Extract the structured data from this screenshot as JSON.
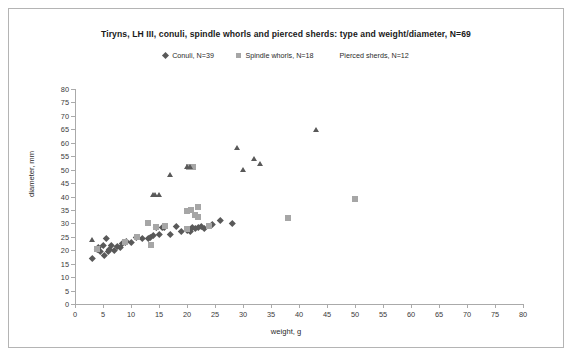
{
  "chart_data": {
    "type": "scatter",
    "title": "Tiryns, LH III,  conuli, spindle whorls and pierced sherds: type and weight/diameter, N=69",
    "xlabel": "weight, g",
    "ylabel": "diameter, mm",
    "xlim": [
      0,
      80
    ],
    "ylim": [
      0,
      80
    ],
    "xticks": [
      0,
      5,
      10,
      15,
      20,
      25,
      30,
      35,
      40,
      45,
      50,
      55,
      60,
      65,
      70,
      75,
      80
    ],
    "yticks": [
      0,
      5,
      10,
      15,
      20,
      25,
      30,
      35,
      40,
      45,
      50,
      55,
      60,
      65,
      70,
      75,
      80
    ],
    "grid": false,
    "legend_position": "top-center",
    "series": [
      {
        "name": "Conuli, N=39",
        "marker": "diamond",
        "color": "#595959",
        "points": [
          [
            3.0,
            17.0
          ],
          [
            4.0,
            20.5
          ],
          [
            4.2,
            21.0
          ],
          [
            4.5,
            19.5
          ],
          [
            5.0,
            22.0
          ],
          [
            5.2,
            18.0
          ],
          [
            5.5,
            24.5
          ],
          [
            6.0,
            19.5
          ],
          [
            6.2,
            20.5
          ],
          [
            6.5,
            22.0
          ],
          [
            7.0,
            20.0
          ],
          [
            7.5,
            21.5
          ],
          [
            8.0,
            21.0
          ],
          [
            8.5,
            22.5
          ],
          [
            9.0,
            23.0
          ],
          [
            9.2,
            23.5
          ],
          [
            10.0,
            23.0
          ],
          [
            11.0,
            25.0
          ],
          [
            12.0,
            24.5
          ],
          [
            13.0,
            24.5
          ],
          [
            13.5,
            25.0
          ],
          [
            14.0,
            25.5
          ],
          [
            14.5,
            28.5
          ],
          [
            15.0,
            26.0
          ],
          [
            15.5,
            28.5
          ],
          [
            16.0,
            28.5
          ],
          [
            17.0,
            26.0
          ],
          [
            18.0,
            29.0
          ],
          [
            19.0,
            27.0
          ],
          [
            20.0,
            27.5
          ],
          [
            20.5,
            27.0
          ],
          [
            21.0,
            28.5
          ],
          [
            21.5,
            28.0
          ],
          [
            22.0,
            28.5
          ],
          [
            23.0,
            28.0
          ],
          [
            24.5,
            29.5
          ],
          [
            26.0,
            31.0
          ],
          [
            28.0,
            30.0
          ],
          [
            22.5,
            29.0
          ]
        ]
      },
      {
        "name": "Spindle whorls, N=18",
        "marker": "square",
        "color": "#a6a6a6",
        "points": [
          [
            4.0,
            20.5
          ],
          [
            9.0,
            23.0
          ],
          [
            11.0,
            25.0
          ],
          [
            13.0,
            30.0
          ],
          [
            13.5,
            22.0
          ],
          [
            14.5,
            28.5
          ],
          [
            16.0,
            29.0
          ],
          [
            20.0,
            34.5
          ],
          [
            20.3,
            51.0
          ],
          [
            20.8,
            35.0
          ],
          [
            21.0,
            51.0
          ],
          [
            21.5,
            33.0
          ],
          [
            22.0,
            36.0
          ],
          [
            22.0,
            32.5
          ],
          [
            20.0,
            28.0
          ],
          [
            24.0,
            29.0
          ],
          [
            38.0,
            32.0
          ],
          [
            50.0,
            39.0
          ]
        ]
      },
      {
        "name": "Pierced sherds, N=12",
        "marker": "triangle",
        "color": "#595959",
        "points": [
          [
            3.0,
            24.0
          ],
          [
            14.0,
            40.5
          ],
          [
            14.3,
            40.5
          ],
          [
            15.0,
            40.5
          ],
          [
            17.0,
            48.0
          ],
          [
            20.0,
            51.0
          ],
          [
            29.0,
            58.0
          ],
          [
            30.0,
            50.0
          ],
          [
            32.0,
            54.0
          ],
          [
            33.0,
            52.0
          ],
          [
            43.0,
            65.0
          ],
          [
            20.5,
            51.0
          ]
        ]
      }
    ]
  },
  "legend": [
    {
      "label": "Conuli, N=39",
      "marker": "diamond",
      "color": "#595959"
    },
    {
      "label": "Spindle whorls, N=18",
      "marker": "square",
      "color": "#a6a6a6"
    },
    {
      "label": "Pierced sherds, N=12",
      "marker": "triangle",
      "color": "#595959"
    }
  ]
}
